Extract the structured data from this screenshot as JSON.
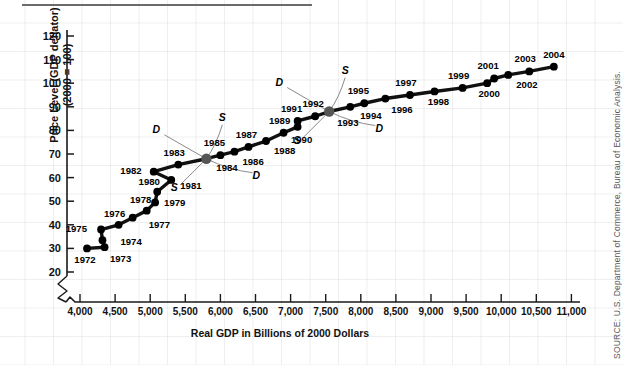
{
  "source_note": "SOURCE: U.S. Department of Commerce, Bureau of Economic Analysis.",
  "axis": {
    "y_title_line1": "Price Level (GDP deflator)",
    "y_title_line2": "(2000 = 100)",
    "x_title": "Real GDP in Billions of 2000 Dollars"
  },
  "chart_data": {
    "type": "scatter",
    "title": "",
    "xlabel": "Real GDP in Billions of 2000 Dollars",
    "ylabel": "Price Level (GDP deflator) (2000 = 100)",
    "xlim": [
      3900,
      11000
    ],
    "ylim": [
      15,
      125
    ],
    "x_broken_axis": true,
    "grid": false,
    "legend": "none",
    "xticks": [
      "4,000",
      "4,500",
      "5,000",
      "5,500",
      "6,000",
      "6,500",
      "7,000",
      "7,500",
      "8,000",
      "8,500",
      "9,000",
      "9,500",
      "10,000",
      "10,500",
      "11,000"
    ],
    "xtick_values": [
      4000,
      4500,
      5000,
      5500,
      6000,
      6500,
      7000,
      7500,
      8000,
      8500,
      9000,
      9500,
      10000,
      10500,
      11000
    ],
    "yticks": [
      "20",
      "30",
      "40",
      "50",
      "60",
      "70",
      "80",
      "90",
      "100",
      "110",
      "120"
    ],
    "ytick_values": [
      20,
      30,
      40,
      50,
      60,
      70,
      80,
      90,
      100,
      110,
      120
    ],
    "points": [
      {
        "label": "1972",
        "x": 4100,
        "y": 30.0
      },
      {
        "label": "1973",
        "x": 4350,
        "y": 30.5
      },
      {
        "label": "1974",
        "x": 4320,
        "y": 33.5
      },
      {
        "label": "1975",
        "x": 4300,
        "y": 38.0
      },
      {
        "label": "1976",
        "x": 4550,
        "y": 40.0
      },
      {
        "label": "1977",
        "x": 4750,
        "y": 43.0
      },
      {
        "label": "1978",
        "x": 4950,
        "y": 46.0
      },
      {
        "label": "1979",
        "x": 5070,
        "y": 49.5
      },
      {
        "label": "1980",
        "x": 5100,
        "y": 54.0
      },
      {
        "label": "1981",
        "x": 5300,
        "y": 59.0
      },
      {
        "label": "1982",
        "x": 5050,
        "y": 62.5
      },
      {
        "label": "1983",
        "x": 5400,
        "y": 65.5
      },
      {
        "label": "1984",
        "x": 5800,
        "y": 68.0
      },
      {
        "label": "1985",
        "x": 6000,
        "y": 69.5
      },
      {
        "label": "1986",
        "x": 6200,
        "y": 71.0
      },
      {
        "label": "1987",
        "x": 6400,
        "y": 73.0
      },
      {
        "label": "1988",
        "x": 6650,
        "y": 75.5
      },
      {
        "label": "1989",
        "x": 6900,
        "y": 79.0
      },
      {
        "label": "1990",
        "x": 7100,
        "y": 81.5
      },
      {
        "label": "1991",
        "x": 7100,
        "y": 84.0
      },
      {
        "label": "1992",
        "x": 7350,
        "y": 86.0
      },
      {
        "label": "1993",
        "x": 7550,
        "y": 88.0
      },
      {
        "label": "1994",
        "x": 7850,
        "y": 90.0
      },
      {
        "label": "1995",
        "x": 8050,
        "y": 91.5
      },
      {
        "label": "1996",
        "x": 8350,
        "y": 93.5
      },
      {
        "label": "1997",
        "x": 8700,
        "y": 95.0
      },
      {
        "label": "1998",
        "x": 9050,
        "y": 96.5
      },
      {
        "label": "1999",
        "x": 9450,
        "y": 98.0
      },
      {
        "label": "2000",
        "x": 9800,
        "y": 100.0
      },
      {
        "label": "2001",
        "x": 9900,
        "y": 102.0
      },
      {
        "label": "2002",
        "x": 10100,
        "y": 103.5
      },
      {
        "label": "2003",
        "x": 10400,
        "y": 105.0
      },
      {
        "label": "2004",
        "x": 10750,
        "y": 107.0
      }
    ],
    "annotations": [
      {
        "text": "D",
        "near": "1984",
        "role": "demand-curve-upper-left"
      },
      {
        "text": "S",
        "near": "1984",
        "role": "supply-curve-upper-right"
      },
      {
        "text": "S",
        "near": "1984",
        "role": "supply-curve-lower-left"
      },
      {
        "text": "D",
        "near": "1984",
        "role": "demand-curve-lower-right"
      },
      {
        "text": "D",
        "near": "1993",
        "role": "demand-curve-upper-left"
      },
      {
        "text": "S",
        "near": "1993",
        "role": "supply-curve-upper-right"
      },
      {
        "text": "S",
        "near": "1993",
        "role": "supply-curve-lower-left"
      },
      {
        "text": "D",
        "near": "1993",
        "role": "demand-curve-lower-right"
      }
    ],
    "highlighted_points": [
      "1984",
      "1993"
    ]
  }
}
